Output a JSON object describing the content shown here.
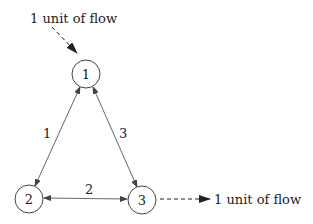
{
  "diagram": {
    "nodes": [
      {
        "id": "1",
        "label": "1",
        "cx": 86,
        "cy": 74
      },
      {
        "id": "2",
        "label": "2",
        "cx": 29,
        "cy": 199
      },
      {
        "id": "3",
        "label": "3",
        "cx": 142,
        "cy": 200
      }
    ],
    "edges": [
      {
        "from": "1",
        "to": "2",
        "label": "1",
        "bidirectional": true
      },
      {
        "from": "1",
        "to": "3",
        "label": "3",
        "bidirectional": true
      },
      {
        "from": "2",
        "to": "3",
        "label": "2",
        "bidirectional": true
      }
    ],
    "source_label": "1 unit of flow",
    "sink_label": "1 unit of flow"
  }
}
